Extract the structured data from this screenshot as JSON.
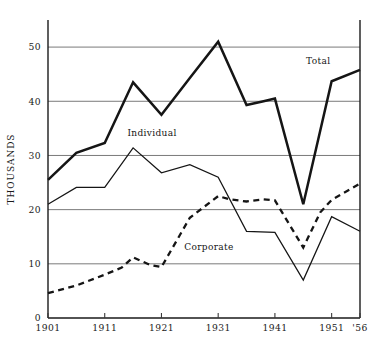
{
  "chart_data": {
    "type": "line",
    "title": "",
    "xlabel": "",
    "ylabel": "THOUSANDS",
    "xlim": [
      1901,
      1956
    ],
    "ylim": [
      0,
      55
    ],
    "grid": true,
    "legend_position": "inline-annotations",
    "x_ticks": [
      {
        "value": 1901,
        "label": "1901"
      },
      {
        "value": 1911,
        "label": "1911"
      },
      {
        "value": 1921,
        "label": "1921"
      },
      {
        "value": 1931,
        "label": "1931"
      },
      {
        "value": 1941,
        "label": "1941"
      },
      {
        "value": 1951,
        "label": "1951"
      },
      {
        "value": 1956,
        "label": "'56"
      }
    ],
    "y_ticks": [
      {
        "value": 0,
        "label": "0"
      },
      {
        "value": 10,
        "label": "10"
      },
      {
        "value": 20,
        "label": "20"
      },
      {
        "value": 30,
        "label": "30"
      },
      {
        "value": 40,
        "label": "40"
      },
      {
        "value": 50,
        "label": "50"
      }
    ],
    "gridlines": [
      10,
      20,
      30,
      40,
      50
    ],
    "series": [
      {
        "name": "Total",
        "label": "Total",
        "style": "thick-solid",
        "label_x": 1946.5,
        "label_y": 46.8,
        "x": [
          1901,
          1906,
          1911,
          1916,
          1921,
          1926,
          1931,
          1936,
          1939,
          1941,
          1946,
          1951,
          1956
        ],
        "values": [
          25.5,
          30.5,
          32.3,
          43.5,
          37.5,
          44.3,
          51.0,
          39.3,
          40.0,
          40.5,
          21.0,
          43.7,
          45.8
        ]
      },
      {
        "name": "Individual",
        "label": "Individual",
        "style": "thin-solid",
        "label_x": 1915.0,
        "label_y": 33.5,
        "x": [
          1901,
          1906,
          1911,
          1916,
          1921,
          1926,
          1931,
          1936,
          1941,
          1946,
          1951,
          1956
        ],
        "values": [
          21.0,
          24.1,
          24.1,
          31.4,
          26.8,
          28.3,
          26.0,
          16.0,
          15.8,
          7.0,
          18.7,
          16.0
        ]
      },
      {
        "name": "Corporate",
        "label": "Corporate",
        "style": "thick-dashed",
        "label_x": 1925.0,
        "label_y": 12.6,
        "x": [
          1901,
          1906,
          1911,
          1914,
          1916,
          1919,
          1921,
          1926,
          1931,
          1933,
          1936,
          1939,
          1941,
          1946,
          1949,
          1951,
          1956
        ],
        "values": [
          4.6,
          6.0,
          8.0,
          9.3,
          11.2,
          9.8,
          9.4,
          18.5,
          22.5,
          21.9,
          21.5,
          21.9,
          21.7,
          13.0,
          19.5,
          21.8,
          24.8
        ]
      }
    ]
  },
  "plot_geometry": {
    "left": 48,
    "right": 360,
    "top": 20,
    "bottom": 318
  }
}
